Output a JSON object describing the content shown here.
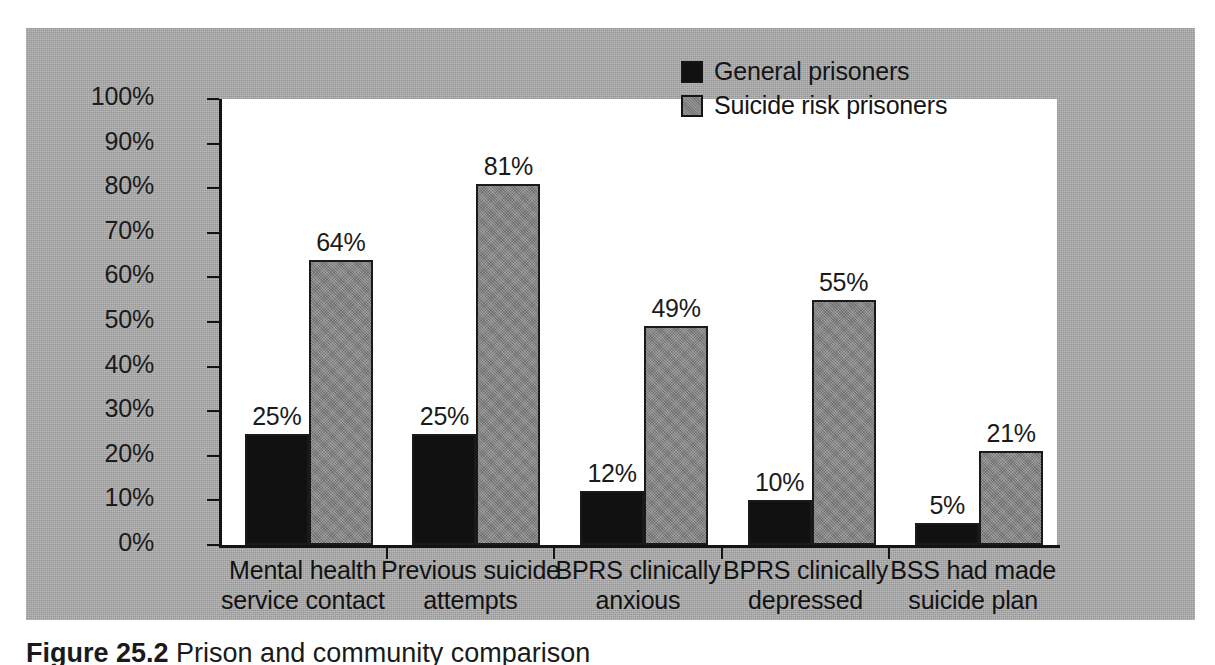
{
  "figure": {
    "caption_label": "Figure 25.2",
    "caption_text": "Prison and community comparison"
  },
  "legend": {
    "position": "top-right",
    "items": [
      {
        "label": "General prisoners",
        "color": "#111111",
        "swatch": "black-square-icon"
      },
      {
        "label": "Suicide risk prisoners",
        "color": "#848484",
        "swatch": "gray-square-icon"
      }
    ]
  },
  "axes": {
    "y_ticks": [
      "0%",
      "10%",
      "20%",
      "30%",
      "40%",
      "50%",
      "60%",
      "70%",
      "80%",
      "90%",
      "100%"
    ],
    "y_min": 0,
    "y_max": 100
  },
  "chart_data": {
    "type": "bar",
    "title": "",
    "subtitle": "",
    "xlabel": "",
    "ylabel": "",
    "ylim": [
      0,
      100
    ],
    "grid": false,
    "legend_position": "top-right",
    "categories": [
      "Mental health\nservice contact",
      "Previous suicide\nattempts",
      "BPRS clinically\nanxious",
      "BPRS clinically\ndepressed",
      "BSS had made\nsuicide plan"
    ],
    "tick_labels": [
      "0%",
      "10%",
      "20%",
      "30%",
      "40%",
      "50%",
      "60%",
      "70%",
      "80%",
      "90%",
      "100%"
    ],
    "series": [
      {
        "name": "General prisoners",
        "color": "#111111",
        "values": [
          25,
          25,
          12,
          10,
          5
        ],
        "data_labels": [
          "25%",
          "25%",
          "12%",
          "10%",
          "5%"
        ]
      },
      {
        "name": "Suicide risk prisoners",
        "color": "#848484",
        "values": [
          64,
          81,
          49,
          55,
          21
        ],
        "data_labels": [
          "64%",
          "81%",
          "49%",
          "55%",
          "21%"
        ]
      }
    ]
  }
}
